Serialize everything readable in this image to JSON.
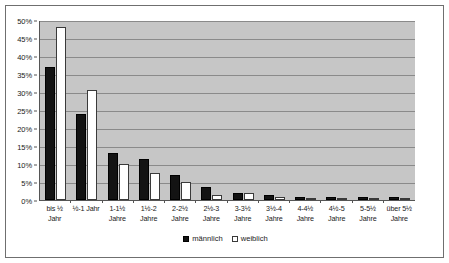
{
  "chart_data": {
    "type": "bar",
    "title": "",
    "xlabel": "",
    "ylabel": "",
    "ylim": [
      0,
      50
    ],
    "yticks": [
      "0%",
      "5%",
      "10%",
      "15%",
      "20%",
      "25%",
      "30%",
      "35%",
      "40%",
      "45%",
      "50%"
    ],
    "ytick_values": [
      0,
      5,
      10,
      15,
      20,
      25,
      30,
      35,
      40,
      45,
      50
    ],
    "grid": true,
    "legend_position": "bottom-center",
    "categories": [
      "bis ½ Jahr",
      "½-1 Jahr",
      "1-1½ Jahre",
      "1½-2 Jahre",
      "2-2½ Jahre",
      "2½-3 Jahre",
      "3-3½ Jahre",
      "3½-4 Jahre",
      "4-4½ Jahre",
      "4½-5 Jahre",
      "5-5½ Jahre",
      "über 5½ Jahre"
    ],
    "category_lines": [
      [
        "bis ½",
        "Jahr"
      ],
      [
        "½-1 Jahr",
        ""
      ],
      [
        "1-1½",
        "Jahre"
      ],
      [
        "1½-2",
        "Jahre"
      ],
      [
        "2-2½",
        "Jahre"
      ],
      [
        "2½-3",
        "Jahre"
      ],
      [
        "3-3½",
        "Jahre"
      ],
      [
        "3½-4",
        "Jahre"
      ],
      [
        "4-4½",
        "Jahre"
      ],
      [
        "4½-5",
        "Jahre"
      ],
      [
        "5-5½",
        "Jahre"
      ],
      [
        "über 5½",
        "Jahre"
      ]
    ],
    "series": [
      {
        "name": "männlich",
        "color": "#131313",
        "values": [
          37,
          24,
          13,
          11.5,
          7,
          3.5,
          2,
          1.5,
          0.8,
          0.7,
          0.7,
          0.7
        ]
      },
      {
        "name": "weiblich",
        "color": "#ffffff",
        "values": [
          48,
          30.5,
          10,
          7.5,
          5,
          1.5,
          2,
          0.7,
          0.4,
          0.4,
          0.4,
          0.4
        ]
      }
    ]
  },
  "legend": {
    "items": [
      {
        "label": "männlich"
      },
      {
        "label": "weiblich"
      }
    ]
  },
  "colors": {
    "plot_background": "#c6c6c6",
    "gridline": "#8a8a8a",
    "axis": "#555555",
    "frame": "#6f6f6f",
    "male": "#131313",
    "female": "#ffffff"
  }
}
